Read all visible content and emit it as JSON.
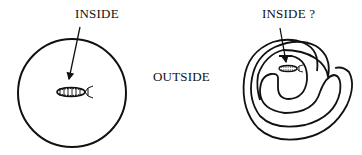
{
  "diagram": {
    "left_panel": {
      "label": "INSIDE",
      "shape": "circle",
      "contents": "insect"
    },
    "middle_label": "OUTSIDE",
    "right_panel": {
      "label": "INSIDE ?",
      "shape": "spiral",
      "contents": "insect"
    },
    "colors": {
      "stroke": "#111111",
      "background": "#ffffff"
    }
  }
}
